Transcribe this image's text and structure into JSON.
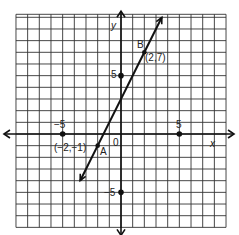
{
  "chart_data": {
    "type": "line",
    "title": "",
    "xlabel": "x",
    "ylabel": "y",
    "xlim": [
      -9,
      9
    ],
    "ylim": [
      -8,
      10
    ],
    "grid": true,
    "ticks_labeled": {
      "x": [
        {
          "value": -5,
          "label": "−5"
        },
        {
          "value": 5,
          "label": "5"
        }
      ],
      "y": [
        {
          "value": 5,
          "label": "5"
        },
        {
          "value": -5,
          "label": "−5"
        }
      ],
      "origin_label": "0"
    },
    "series": [
      {
        "name": "line AB",
        "equation": "y = 2x + 3",
        "x": [
          -3.5,
          3.5
        ],
        "y": [
          -4,
          10
        ],
        "arrow_both_ends": true
      }
    ],
    "points": [
      {
        "name": "A",
        "x": -2,
        "y": -1,
        "label": "(−2,−1)"
      },
      {
        "name": "B",
        "x": 2,
        "y": 7,
        "label": "(2,7)"
      }
    ]
  },
  "labels": {
    "x_axis": "x",
    "y_axis": "y",
    "origin": "0",
    "x_neg5": "−5",
    "x_pos5": "5",
    "y_pos5": "5",
    "y_neg5": "−5",
    "point_a_name": "A",
    "point_a_coords": "(−2,−1)",
    "point_b_name": "B",
    "point_b_coords": "(2,7)"
  }
}
